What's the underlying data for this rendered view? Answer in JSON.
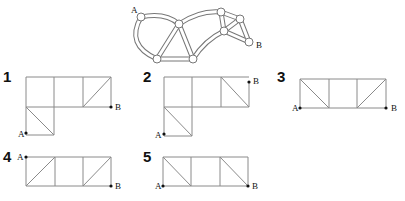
{
  "reference": {
    "label_a": "A",
    "label_b": "B",
    "nodes": [
      [
        141,
        17
      ],
      [
        179,
        24
      ],
      [
        157,
        59
      ],
      [
        193,
        59
      ],
      [
        221,
        12
      ],
      [
        240,
        19
      ],
      [
        224,
        31
      ],
      [
        249,
        42
      ]
    ]
  },
  "options": [
    {
      "number": "1",
      "label_a": "A",
      "label_b": "B"
    },
    {
      "number": "2",
      "label_a": "A",
      "label_b": "B"
    },
    {
      "number": "3",
      "label_a": "A",
      "label_b": "B"
    },
    {
      "number": "4",
      "label_a": "A",
      "label_b": "B"
    },
    {
      "number": "5",
      "label_a": "A",
      "label_b": "B"
    }
  ]
}
